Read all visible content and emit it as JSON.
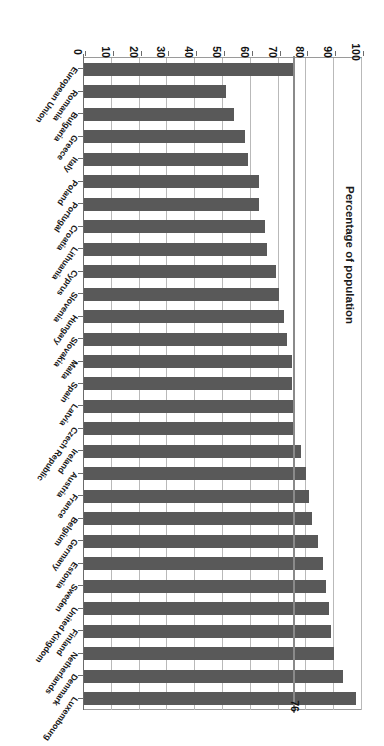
{
  "chart": {
    "type": "bar",
    "orientation": "horizontal",
    "axis_title": "Percentage of population",
    "reference_label": "76",
    "tick_labels": [
      "0",
      "10",
      "20",
      "30",
      "40",
      "50",
      "60",
      "70",
      "80",
      "90",
      "100"
    ],
    "bar_color": "#595959",
    "grid_color": "#b9b9b9",
    "reference_color": "#8a8a8a"
  },
  "chart_data": {
    "type": "bar",
    "title": "",
    "subtitle": "",
    "xlabel": "Percentage of population",
    "ylabel": "",
    "orientation": "horizontal",
    "grid": true,
    "legend": false,
    "xlim": [
      0,
      100
    ],
    "xticks": [
      0,
      10,
      20,
      30,
      40,
      50,
      60,
      70,
      80,
      90,
      100
    ],
    "reference_line": {
      "value": 76,
      "label": "76",
      "name": "European Union average"
    },
    "categories": [
      "Luxembourg",
      "Denmark",
      "Netherlands",
      "Finland",
      "United Kingdom",
      "Sweden",
      "Estonia",
      "Germany",
      "Belgium",
      "France",
      "Austria",
      "Ireland",
      "Czech Republic",
      "Latvia",
      "Spain",
      "Malta",
      "Slovakia",
      "Hungary",
      "Slovenia",
      "Cyprus",
      "Lithuania",
      "Croatia",
      "Portugal",
      "Poland",
      "Italy",
      "Greece",
      "Bulgaria",
      "Romania",
      "European Union"
    ],
    "values": [
      98,
      93,
      90,
      89,
      88,
      87,
      86,
      84,
      82,
      81,
      80,
      78,
      76,
      76,
      75,
      75,
      73,
      72,
      70,
      69,
      66,
      65,
      63,
      63,
      59,
      58,
      54,
      51,
      76
    ],
    "series": [
      {
        "name": "Percentage of population",
        "values": [
          98,
          93,
          90,
          89,
          88,
          87,
          86,
          84,
          82,
          81,
          80,
          78,
          76,
          76,
          75,
          75,
          73,
          72,
          70,
          69,
          66,
          65,
          63,
          63,
          59,
          58,
          54,
          51,
          76
        ]
      }
    ]
  }
}
